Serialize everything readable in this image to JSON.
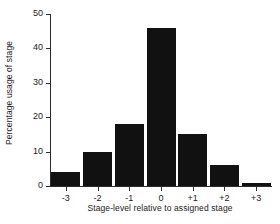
{
  "chart_data": {
    "type": "bar",
    "title": "",
    "subtitle": "",
    "xlabel": "Stage-level relative to assigned stage",
    "ylabel": "Percentage usage of stage",
    "categories": [
      "-3",
      "-2",
      "-1",
      "0",
      "+1",
      "+2",
      "+3"
    ],
    "values": [
      4,
      10,
      18,
      46,
      15,
      6,
      1
    ],
    "series": [
      {
        "name": "Percentage usage of stage",
        "values": [
          4,
          10,
          18,
          46,
          15,
          6,
          1
        ]
      }
    ],
    "ylim": [
      0,
      50
    ],
    "yticks": [
      0,
      10,
      20,
      30,
      40,
      50
    ],
    "ytick_labels": [
      "0",
      "10",
      "20",
      "30",
      "40",
      "50"
    ],
    "xtick_labels": [
      "-3",
      "-2",
      "-1",
      "0",
      "+1",
      "+2",
      "+3"
    ],
    "grid": false,
    "legend": false,
    "legend_position": "none",
    "bar_color": "#111111",
    "axis_color": "#2b2b2b",
    "background_color": "#ffffff",
    "annotations": []
  }
}
